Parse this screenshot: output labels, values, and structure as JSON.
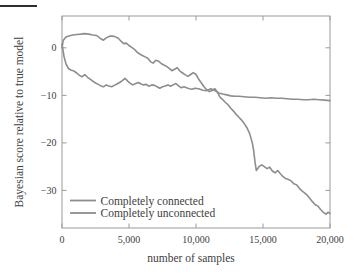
{
  "figure": {
    "background": "#ffffff",
    "artifact_color": "#2e2e2e"
  },
  "chart_data": {
    "type": "line",
    "title": "",
    "xlabel": "number of samples",
    "ylabel": "Bayesian score relative to true model",
    "xlim": [
      0,
      20000
    ],
    "ylim": [
      -37.9,
      6.7
    ],
    "x_ticks": [
      0,
      5000,
      10000,
      15000,
      20000
    ],
    "x_tick_labels": [
      "0",
      "5,000",
      "10,000",
      "15,000",
      "20,000"
    ],
    "y_ticks": [
      0,
      -10,
      -20,
      -30
    ],
    "y_tick_labels": [
      "0",
      "−10",
      "−20",
      "−30"
    ],
    "grid": false,
    "frame": true,
    "legend_position": "inside lower left",
    "axis_color": "#9a9a9a",
    "text_color": "#3e3e3e",
    "series": [
      {
        "name": "Completely connected",
        "color": "#8d8d8d",
        "x": [
          0,
          100,
          300,
          500,
          800,
          1100,
          1400,
          1700,
          2000,
          2300,
          2600,
          2900,
          3100,
          3300,
          3600,
          3900,
          4200,
          4400,
          4600,
          4800,
          5000,
          5200,
          5400,
          5600,
          5800,
          6000,
          6200,
          6400,
          6600,
          6800,
          7000,
          7200,
          7400,
          7600,
          7800,
          8000,
          8200,
          8400,
          8600,
          8800,
          9000,
          9200,
          9400,
          9600,
          9800,
          10000,
          10200,
          10400,
          10600,
          10800,
          11000,
          11200,
          11400,
          11600,
          11800,
          12000,
          12200,
          12400,
          12600,
          12800,
          13000,
          13200,
          13400,
          13600,
          13800,
          14000,
          14200,
          14300,
          14400,
          14500,
          14700,
          14900,
          15100,
          15300,
          15500,
          15700,
          15900,
          16100,
          16300,
          16500,
          16700,
          16900,
          17100,
          17300,
          17500,
          17700,
          17900,
          18100,
          18300,
          18500,
          18700,
          18900,
          19100,
          19300,
          19500,
          19700,
          19850,
          20000
        ],
        "y": [
          0,
          1.6,
          2.3,
          2.5,
          2.7,
          2.8,
          2.9,
          3.0,
          2.9,
          2.7,
          2.6,
          1.9,
          1.6,
          2.1,
          2.5,
          2.4,
          2.0,
          1.4,
          0.9,
          1.0,
          0.5,
          0.1,
          -0.3,
          -0.9,
          -1.3,
          -1.6,
          -1.9,
          -2.2,
          -2.9,
          -3.2,
          -2.6,
          -2.8,
          -3.3,
          -3.6,
          -3.9,
          -4.3,
          -4.8,
          -4.5,
          -4.2,
          -4.9,
          -5.3,
          -5.7,
          -6.0,
          -5.6,
          -5.2,
          -5.6,
          -6.6,
          -7.4,
          -8.2,
          -8.8,
          -9.2,
          -9.0,
          -8.6,
          -9.3,
          -10.4,
          -10.9,
          -11.5,
          -12.0,
          -12.7,
          -13.3,
          -14.0,
          -14.6,
          -15.2,
          -15.9,
          -16.8,
          -18.0,
          -20.0,
          -21.5,
          -24.0,
          -25.8,
          -25.0,
          -24.6,
          -25.0,
          -25.4,
          -25.1,
          -25.9,
          -26.3,
          -25.8,
          -26.5,
          -27.1,
          -27.5,
          -27.7,
          -28.0,
          -28.6,
          -28.8,
          -29.5,
          -30.1,
          -30.5,
          -31.0,
          -31.7,
          -32.4,
          -33.0,
          -33.3,
          -34.0,
          -34.6,
          -35.0,
          -34.6,
          -34.8
        ]
      },
      {
        "name": "Completely unconnected",
        "color": "#8d8d8d",
        "x": [
          0,
          150,
          300,
          500,
          700,
          900,
          1100,
          1300,
          1500,
          1700,
          1900,
          2100,
          2300,
          2500,
          2700,
          2900,
          3100,
          3300,
          3500,
          3700,
          3900,
          4100,
          4300,
          4500,
          4700,
          4900,
          5100,
          5300,
          5500,
          5700,
          5900,
          6100,
          6300,
          6500,
          6700,
          6900,
          7100,
          7300,
          7500,
          7700,
          7900,
          8100,
          8300,
          8500,
          8700,
          8900,
          9100,
          9300,
          9500,
          9700,
          9900,
          10200,
          10500,
          10800,
          11100,
          11400,
          11700,
          12000,
          12300,
          12600,
          12900,
          13200,
          13600,
          14000,
          14400,
          14800,
          15200,
          15600,
          16000,
          16400,
          16800,
          17200,
          17600,
          18000,
          18400,
          18800,
          19200,
          19600,
          20000
        ],
        "y": [
          0.8,
          -1.8,
          -3.4,
          -4.4,
          -4.7,
          -4.9,
          -5.3,
          -5.8,
          -6.1,
          -5.6,
          -6.2,
          -6.6,
          -7.0,
          -7.4,
          -7.7,
          -8.0,
          -8.2,
          -7.8,
          -8.0,
          -8.2,
          -7.9,
          -7.6,
          -7.3,
          -6.9,
          -6.4,
          -7.0,
          -7.5,
          -7.8,
          -7.5,
          -7.3,
          -7.6,
          -7.8,
          -7.7,
          -8.1,
          -7.8,
          -7.9,
          -8.2,
          -8.5,
          -8.2,
          -8.0,
          -7.8,
          -8.1,
          -7.8,
          -7.5,
          -8.0,
          -8.4,
          -8.2,
          -8.4,
          -8.6,
          -8.7,
          -8.5,
          -8.6,
          -8.9,
          -9.0,
          -8.6,
          -9.0,
          -9.5,
          -9.7,
          -9.9,
          -10.1,
          -10.2,
          -10.2,
          -10.3,
          -10.4,
          -10.4,
          -10.5,
          -10.6,
          -10.5,
          -10.6,
          -10.6,
          -10.7,
          -10.8,
          -10.8,
          -10.9,
          -10.9,
          -10.8,
          -10.9,
          -11.0,
          -11.1
        ]
      }
    ]
  }
}
